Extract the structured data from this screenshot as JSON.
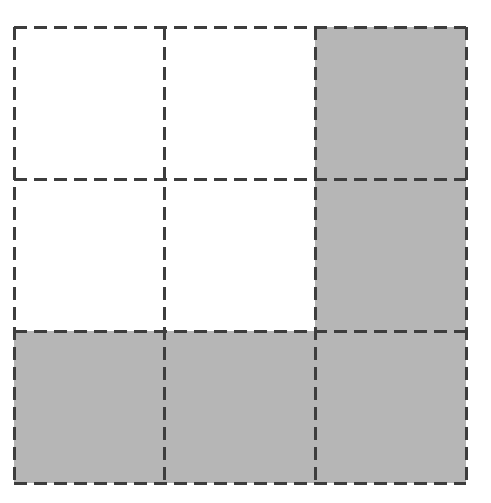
{
  "figure": {
    "name": "shaded-fraction-grid",
    "background_color": "#ffffff"
  },
  "grid": {
    "rows": 3,
    "columns": 3,
    "total_cells": 9,
    "shaded_cells": 5,
    "unshaded_cells": 4,
    "fraction_shaded": "5/9",
    "origin_x": 14,
    "origin_y": 27,
    "cell_width": 150.7,
    "cell_height": 152,
    "x_boundaries": [
      14,
      164.7,
      315.3,
      466
    ],
    "y_boundaries": [
      27,
      179,
      331,
      483
    ]
  },
  "style": {
    "shaded_color": "#b6b6b6",
    "unshaded_color": "#ffffff",
    "line_color": "#3d3d3d",
    "line_width": 3,
    "dash_length": 13,
    "dash_gap": 7
  },
  "cells": [
    {
      "id": "cell-r0-c0",
      "row": 0,
      "col": 0,
      "shaded": false,
      "fill": "#ffffff"
    },
    {
      "id": "cell-r0-c1",
      "row": 0,
      "col": 1,
      "shaded": false,
      "fill": "#ffffff"
    },
    {
      "id": "cell-r0-c2",
      "row": 0,
      "col": 2,
      "shaded": true,
      "fill": "#b6b6b6"
    },
    {
      "id": "cell-r1-c0",
      "row": 1,
      "col": 0,
      "shaded": false,
      "fill": "#ffffff"
    },
    {
      "id": "cell-r1-c1",
      "row": 1,
      "col": 1,
      "shaded": false,
      "fill": "#ffffff"
    },
    {
      "id": "cell-r1-c2",
      "row": 1,
      "col": 2,
      "shaded": true,
      "fill": "#b6b6b6"
    },
    {
      "id": "cell-r2-c0",
      "row": 2,
      "col": 0,
      "shaded": true,
      "fill": "#b6b6b6"
    },
    {
      "id": "cell-r2-c1",
      "row": 2,
      "col": 1,
      "shaded": true,
      "fill": "#b6b6b6"
    },
    {
      "id": "cell-r2-c2",
      "row": 2,
      "col": 2,
      "shaded": true,
      "fill": "#b6b6b6"
    }
  ],
  "chart_data": {
    "type": "heatmap",
    "title": "",
    "xlabel": "",
    "ylabel": "",
    "categories": [
      "col-0",
      "col-1",
      "col-2"
    ],
    "row_labels": [
      "row-0",
      "row-1",
      "row-2"
    ],
    "values": [
      [
        0,
        0,
        1
      ],
      [
        0,
        0,
        1
      ],
      [
        1,
        1,
        1
      ]
    ],
    "value_legend": {
      "0": "unshaded (white)",
      "1": "shaded (gray)"
    },
    "colors": {
      "0": "#ffffff",
      "1": "#b6b6b6"
    },
    "grid": true,
    "legend": "none",
    "annotations": []
  }
}
